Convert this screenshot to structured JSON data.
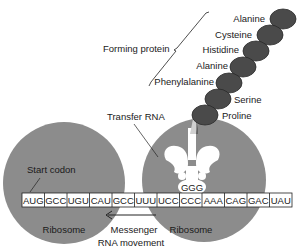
{
  "diagram": {
    "colors": {
      "ribosome": "#8c8c8c",
      "amino_acid": "#4a4a4a",
      "amino_acid_edge": "#2a2a2a",
      "line": "#222222",
      "background": "#ffffff"
    },
    "labels": {
      "forming_protein": "Forming protein",
      "transfer_rna": "Transfer RNA",
      "start_codon": "Start codon",
      "ribosome_left": "Ribosome",
      "ribosome_right": "Ribosome",
      "messenger_line1": "Messenger",
      "messenger_line2": "RNA movement",
      "anticodon": "GGG"
    },
    "amino_acids": [
      {
        "name": "Alanine"
      },
      {
        "name": "Cysteine"
      },
      {
        "name": "Histidine"
      },
      {
        "name": "Alanine"
      },
      {
        "name": "Phenylalanine"
      },
      {
        "name": "Serine"
      },
      {
        "name": "Proline"
      }
    ],
    "mrna_codons": [
      "AUG",
      "GCC",
      "UGU",
      "CAU",
      "GCC",
      "UUU",
      "UCC",
      "CCC",
      "AAA",
      "CAG",
      "GAC",
      "UAU"
    ],
    "arrow_direction": "left"
  }
}
